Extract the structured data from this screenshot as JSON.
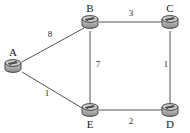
{
  "diagram": {
    "type": "network-graph",
    "title": "",
    "node_icon": "router-icon",
    "colors": {
      "background": "#ffffff",
      "edge": "#555555",
      "label": "#1a1a1a",
      "icon_body": "#b8b8b8",
      "icon_outline": "#3a3a3a"
    },
    "nodes": [
      {
        "id": "A",
        "label": "A",
        "x": 13,
        "y": 66,
        "label_x": 6,
        "label_y": 47
      },
      {
        "id": "B",
        "label": "B",
        "x": 90,
        "y": 22,
        "label_x": 83,
        "label_y": 3
      },
      {
        "id": "C",
        "label": "C",
        "x": 170,
        "y": 22,
        "label_x": 163,
        "label_y": 3
      },
      {
        "id": "D",
        "label": "D",
        "x": 170,
        "y": 110,
        "label_x": 163,
        "label_y": 119
      },
      {
        "id": "E",
        "label": "E",
        "x": 90,
        "y": 110,
        "label_x": 83,
        "label_y": 119
      }
    ],
    "edges": [
      {
        "id": "AB",
        "from": "A",
        "to": "B",
        "weight": "8",
        "x1": 22,
        "y1": 62,
        "x2": 84,
        "y2": 28,
        "label_x": 45,
        "label_y": 30
      },
      {
        "id": "AE",
        "from": "A",
        "to": "E",
        "weight": "1",
        "x1": 22,
        "y1": 72,
        "x2": 82,
        "y2": 108,
        "label_x": 42,
        "label_y": 89
      },
      {
        "id": "BC",
        "from": "B",
        "to": "C",
        "weight": "3",
        "x1": 99,
        "y1": 22,
        "x2": 162,
        "y2": 22,
        "label_x": 126,
        "label_y": 9
      },
      {
        "id": "BE",
        "from": "B",
        "to": "E",
        "weight": "7",
        "x1": 90,
        "y1": 31,
        "x2": 90,
        "y2": 103,
        "label_x": 93,
        "label_y": 60
      },
      {
        "id": "CD",
        "from": "C",
        "to": "D",
        "weight": "1",
        "x1": 170,
        "y1": 31,
        "x2": 170,
        "y2": 103,
        "label_x": 161,
        "label_y": 60
      },
      {
        "id": "ED",
        "from": "E",
        "to": "D",
        "weight": "2",
        "x1": 99,
        "y1": 110,
        "x2": 162,
        "y2": 110,
        "label_x": 126,
        "label_y": 117
      }
    ]
  }
}
